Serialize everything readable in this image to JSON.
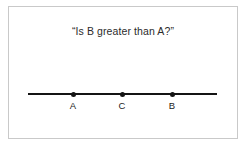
{
  "figure": {
    "title": "“Is B greater than A?”",
    "background_color": "#ffffff",
    "border_color": "#c9c9c9",
    "ink_color": "#141414",
    "text_color": "#2b2b2b"
  },
  "chart_data": {
    "type": "scatter",
    "title": "“Is B greater than A?”",
    "xlabel": "",
    "ylabel": "",
    "orientation": "horizontal-number-line",
    "grid": false,
    "legend": null,
    "axis_line": {
      "x_start_px": 28,
      "x_end_px": 217,
      "y_px": 94
    },
    "categories": [
      "A",
      "C",
      "B"
    ],
    "points": [
      {
        "label": "A",
        "x_px": 73,
        "y_px": 94,
        "order": 1
      },
      {
        "label": "C",
        "x_px": 122,
        "y_px": 94,
        "order": 2
      },
      {
        "label": "B",
        "x_px": 172,
        "y_px": 94,
        "order": 3
      }
    ],
    "values": [
      73,
      122,
      172
    ],
    "xlim": [
      28,
      217
    ]
  }
}
